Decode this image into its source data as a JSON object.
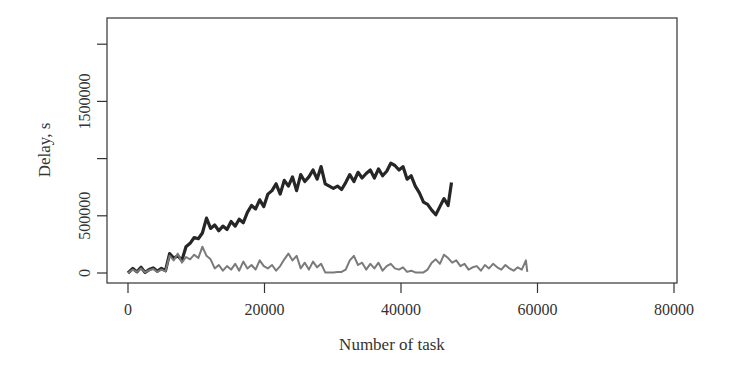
{
  "chart_data": {
    "type": "line",
    "title": "",
    "xlabel": "Number of task",
    "ylabel": "Delay, s",
    "xlim": [
      -4000,
      81000
    ],
    "ylim": [
      -30000,
      2230000
    ],
    "xticks": [
      0,
      20000,
      40000,
      60000,
      80000
    ],
    "xtick_labels": [
      "0",
      "20000",
      "40000",
      "60000",
      "80000"
    ],
    "yticks": [
      0,
      500000,
      1000000,
      1500000,
      2000000
    ],
    "ytick_labels": [
      "0",
      "500000",
      "",
      "1500000",
      ""
    ],
    "grid": false,
    "legend": null,
    "series": [
      {
        "name": "series-dark",
        "color": "#262626",
        "width": 3.2,
        "x": [
          0,
          700,
          1300,
          1900,
          2500,
          3100,
          3700,
          4300,
          4900,
          5500,
          6100,
          6700,
          7300,
          7900,
          8500,
          9100,
          9700,
          10300,
          10900,
          11500,
          12100,
          12700,
          13300,
          13900,
          14500,
          15100,
          15700,
          16300,
          16900,
          17500,
          18100,
          18700,
          19300,
          19900,
          20500,
          21100,
          21700,
          22300,
          22900,
          23500,
          24100,
          24700,
          25300,
          25900,
          26500,
          27100,
          27700,
          28300,
          28900,
          29500,
          30100,
          30700,
          31300,
          31900,
          32500,
          33100,
          33700,
          34300,
          34900,
          35500,
          36100,
          36700,
          37300,
          37900,
          38500,
          39100,
          39700,
          40300,
          40900,
          41500,
          42100,
          42700,
          43300,
          43900,
          44500,
          45100,
          45700,
          46300,
          46900,
          47400
        ],
        "values": [
          0,
          40000,
          10000,
          50000,
          5000,
          30000,
          45000,
          15000,
          40000,
          20000,
          170000,
          130000,
          150000,
          110000,
          230000,
          260000,
          310000,
          300000,
          350000,
          480000,
          390000,
          420000,
          370000,
          410000,
          380000,
          450000,
          410000,
          470000,
          440000,
          530000,
          590000,
          560000,
          640000,
          580000,
          690000,
          720000,
          780000,
          690000,
          810000,
          760000,
          840000,
          720000,
          860000,
          800000,
          840000,
          900000,
          820000,
          930000,
          780000,
          760000,
          740000,
          760000,
          730000,
          790000,
          860000,
          800000,
          880000,
          830000,
          870000,
          900000,
          830000,
          910000,
          850000,
          890000,
          960000,
          940000,
          900000,
          930000,
          820000,
          850000,
          760000,
          700000,
          620000,
          600000,
          550000,
          510000,
          580000,
          650000,
          590000,
          790000
        ]
      },
      {
        "name": "series-gray",
        "color": "#7a7a7a",
        "width": 2.0,
        "x": [
          0,
          700,
          1300,
          1900,
          2500,
          3100,
          3700,
          4300,
          4900,
          5500,
          6100,
          6700,
          7300,
          7900,
          8500,
          9100,
          9700,
          10300,
          10900,
          11500,
          12100,
          12700,
          13300,
          13900,
          14500,
          15100,
          15700,
          16300,
          16900,
          17500,
          18100,
          18700,
          19300,
          19900,
          20500,
          21100,
          21700,
          22300,
          22900,
          23500,
          24100,
          24700,
          25300,
          25900,
          26500,
          27100,
          27700,
          28300,
          28900,
          29500,
          30100,
          30700,
          31300,
          31900,
          32500,
          33100,
          33700,
          34300,
          34900,
          35500,
          36100,
          36700,
          37300,
          37900,
          38500,
          39100,
          39700,
          40300,
          40900,
          41500,
          42100,
          42700,
          43300,
          43900,
          44500,
          45100,
          45700,
          46300,
          46900,
          47500,
          48100,
          48700,
          49300,
          49900,
          50500,
          51100,
          51700,
          52300,
          52900,
          53500,
          54100,
          54700,
          55300,
          55900,
          56500,
          57100,
          57700,
          58300,
          58500
        ],
        "values": [
          0,
          30000,
          10000,
          40000,
          5000,
          25000,
          35000,
          10000,
          30000,
          15000,
          150000,
          110000,
          170000,
          90000,
          140000,
          120000,
          160000,
          130000,
          230000,
          150000,
          120000,
          40000,
          70000,
          20000,
          60000,
          30000,
          80000,
          20000,
          100000,
          40000,
          70000,
          30000,
          110000,
          60000,
          40000,
          70000,
          20000,
          60000,
          120000,
          170000,
          110000,
          150000,
          40000,
          90000,
          30000,
          100000,
          50000,
          80000,
          5000,
          5000,
          5000,
          10000,
          10000,
          30000,
          110000,
          150000,
          70000,
          90000,
          30000,
          80000,
          40000,
          90000,
          20000,
          60000,
          80000,
          40000,
          30000,
          50000,
          10000,
          20000,
          5000,
          5000,
          5000,
          30000,
          90000,
          120000,
          80000,
          160000,
          130000,
          90000,
          110000,
          60000,
          80000,
          30000,
          50000,
          60000,
          20000,
          70000,
          40000,
          80000,
          50000,
          30000,
          70000,
          40000,
          20000,
          50000,
          30000,
          110000,
          10000
        ]
      }
    ]
  },
  "plot_box": {
    "left": 107,
    "top": 18,
    "right": 677,
    "bottom": 283
  }
}
